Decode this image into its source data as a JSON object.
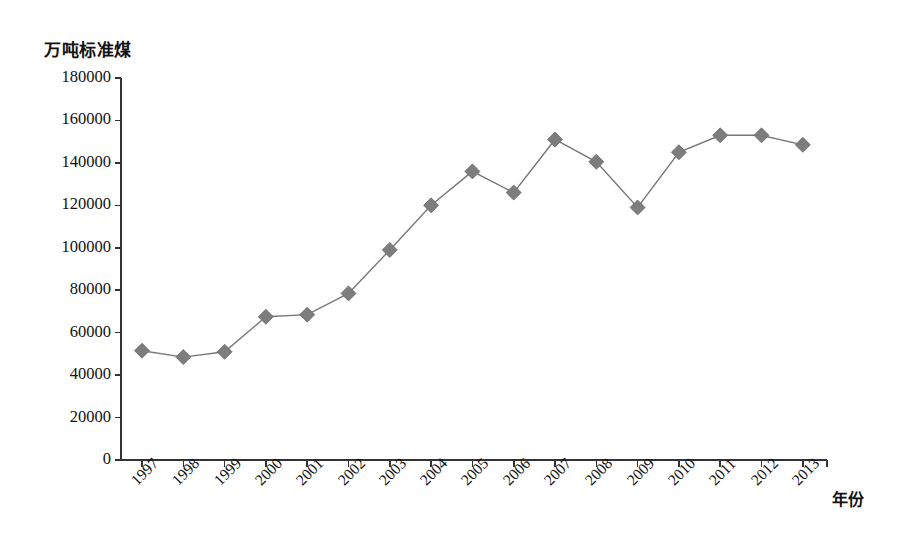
{
  "chart_data": {
    "type": "line",
    "title": "",
    "subtitle": "",
    "xlabel": "年份",
    "ylabel": "万吨标准煤",
    "categories": [
      "1997",
      "1998",
      "1999",
      "2000",
      "2001",
      "2002",
      "2003",
      "2004",
      "2005",
      "2006",
      "2007",
      "2008",
      "2009",
      "2010",
      "2011",
      "2012",
      "2013"
    ],
    "values": [
      51500,
      48500,
      51000,
      67500,
      68500,
      78500,
      99000,
      120000,
      136000,
      126000,
      151000,
      140500,
      119000,
      145000,
      153000,
      153000,
      148500
    ],
    "series": [
      {
        "name": "能源消费总量",
        "values": [
          51500,
          48500,
          51000,
          67500,
          68500,
          78500,
          99000,
          120000,
          136000,
          126000,
          151000,
          140500,
          119000,
          145000,
          153000,
          153000,
          148500
        ]
      }
    ],
    "x": [
      1997,
      1998,
      1999,
      2000,
      2001,
      2002,
      2003,
      2004,
      2005,
      2006,
      2007,
      2008,
      2009,
      2010,
      2011,
      2012,
      2013
    ],
    "ylim": [
      0,
      180000
    ],
    "xlim": [
      1997,
      2013
    ],
    "yticks": [
      0,
      20000,
      40000,
      60000,
      80000,
      100000,
      120000,
      140000,
      160000,
      180000
    ],
    "ytick_labels": [
      "0",
      "20000",
      "40000",
      "60000",
      "80000",
      "100000",
      "120000",
      "140000",
      "160000",
      "180000"
    ],
    "xtick_labels": [
      "1997",
      "1998",
      "1999",
      "2000",
      "2001",
      "2002",
      "2003",
      "2004",
      "2005",
      "2006",
      "2007",
      "2008",
      "2009",
      "2010",
      "2011",
      "2012",
      "2013"
    ],
    "grid": false,
    "legend": "none",
    "marker": "diamond",
    "marker_color": "#7d7d7d",
    "line_color": "#777777",
    "axis_color": "#333333",
    "background_color": "#ffffff",
    "xtick_rotation": -45
  },
  "axis": {
    "unit_label": "万吨标准煤",
    "x_title": "年份"
  }
}
